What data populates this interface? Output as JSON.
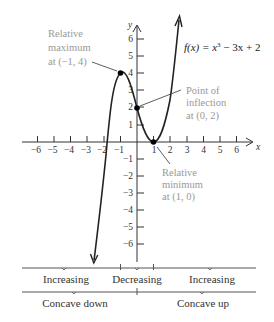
{
  "function_label": "f(x) = x³ − 3x + 2",
  "function_parts": {
    "fx": "f(x) = x",
    "exp": "3",
    "rest": " − 3x + 2"
  },
  "axes": {
    "x_label": "x",
    "y_label": "y",
    "x_ticks": [
      "−6",
      "−5",
      "−4",
      "−3",
      "−2",
      "−1",
      "1",
      "2",
      "3",
      "4",
      "5",
      "6"
    ],
    "y_ticks": [
      "6",
      "5",
      "4",
      "3",
      "2",
      "1",
      "−1",
      "−2",
      "−3",
      "−4",
      "−5",
      "−6"
    ]
  },
  "annotations": {
    "max": {
      "line1": "Relative",
      "line2": "maximum",
      "line3": "at (−1, 4)"
    },
    "inflection": {
      "line1": "Point of",
      "line2": "inflection",
      "line3": "at (0, 2)"
    },
    "min": {
      "line1": "Relative",
      "line2": "minimum",
      "line3": "at (1, 0)"
    }
  },
  "intervals": {
    "monotonic": [
      "Increasing",
      "Decreasing",
      "Increasing"
    ],
    "concavity": [
      "Concave down",
      "Concave up"
    ]
  },
  "points": [
    {
      "name": "relative-maximum",
      "x": -1,
      "y": 4
    },
    {
      "name": "point-of-inflection",
      "x": 0,
      "y": 2
    },
    {
      "name": "relative-minimum",
      "x": 1,
      "y": 0
    }
  ]
}
